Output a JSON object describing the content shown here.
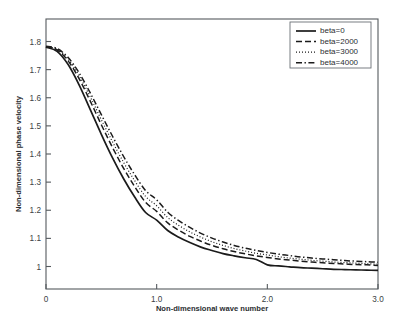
{
  "chart_data": {
    "type": "line",
    "title": "",
    "xlabel": "Non-dimensional wave number",
    "ylabel": "Non-dimensional phase velocity",
    "xlim": [
      0,
      3.0
    ],
    "ylim": [
      0.92,
      1.88
    ],
    "xticks": [
      "0",
      "1.0",
      "2.0",
      "3.0"
    ],
    "xtick_values": [
      0,
      1.0,
      2.0,
      3.0
    ],
    "yticks": [
      "1",
      "1.1",
      "1.2",
      "1.3",
      "1.4",
      "1.5",
      "1.6",
      "1.7",
      "1.8"
    ],
    "ytick_values": [
      1.0,
      1.1,
      1.2,
      1.3,
      1.4,
      1.5,
      1.6,
      1.7,
      1.8
    ],
    "grid": false,
    "legend_position": "upper-right",
    "x": [
      0,
      0.1,
      0.2,
      0.3,
      0.4,
      0.5,
      0.6,
      0.7,
      0.8,
      0.9,
      1.0,
      1.1,
      1.2,
      1.3,
      1.4,
      1.5,
      1.6,
      1.7,
      1.8,
      1.9,
      2.0,
      2.1,
      2.2,
      2.3,
      2.4,
      2.5,
      2.6,
      2.7,
      2.8,
      2.9,
      3.0
    ],
    "series": [
      {
        "name": "beta=0",
        "linestyle": "solid",
        "color": "#1b1b1b",
        "values": [
          1.78,
          1.765,
          1.718,
          1.645,
          1.558,
          1.47,
          1.387,
          1.313,
          1.248,
          1.192,
          1.165,
          1.128,
          1.104,
          1.085,
          1.069,
          1.057,
          1.046,
          1.038,
          1.031,
          1.025,
          1.006,
          1.002,
          0.999,
          0.996,
          0.994,
          0.992,
          0.99,
          0.989,
          0.988,
          0.987,
          0.986
        ]
      },
      {
        "name": "beta=2000",
        "linestyle": "dashed",
        "color": "#1b1b1b",
        "values": [
          1.781,
          1.77,
          1.731,
          1.667,
          1.588,
          1.504,
          1.424,
          1.35,
          1.285,
          1.228,
          1.196,
          1.155,
          1.129,
          1.107,
          1.09,
          1.075,
          1.063,
          1.053,
          1.045,
          1.038,
          1.032,
          1.027,
          1.023,
          1.019,
          1.016,
          1.013,
          1.011,
          1.009,
          1.007,
          1.006,
          1.004
        ]
      },
      {
        "name": "beta=3000",
        "linestyle": "dotted",
        "color": "#1b1b1b",
        "values": [
          1.782,
          1.772,
          1.737,
          1.678,
          1.603,
          1.522,
          1.444,
          1.371,
          1.306,
          1.249,
          1.216,
          1.174,
          1.146,
          1.123,
          1.104,
          1.088,
          1.075,
          1.064,
          1.055,
          1.047,
          1.041,
          1.035,
          1.03,
          1.026,
          1.022,
          1.019,
          1.016,
          1.014,
          1.012,
          1.01,
          1.008
        ]
      },
      {
        "name": "beta=4000",
        "linestyle": "dashdot",
        "color": "#1b1b1b",
        "values": [
          1.783,
          1.775,
          1.743,
          1.688,
          1.617,
          1.54,
          1.464,
          1.392,
          1.327,
          1.27,
          1.237,
          1.193,
          1.163,
          1.139,
          1.118,
          1.101,
          1.087,
          1.075,
          1.065,
          1.057,
          1.05,
          1.044,
          1.039,
          1.034,
          1.03,
          1.027,
          1.024,
          1.021,
          1.019,
          1.017,
          1.015
        ]
      }
    ],
    "legend": [
      "beta=0",
      "beta=2000",
      "beta=3000",
      "beta=4000"
    ]
  }
}
